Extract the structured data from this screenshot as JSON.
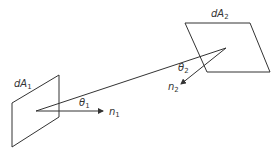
{
  "diagram": {
    "type": "radiation view factor between two differential areas",
    "colors": {
      "line": "#333333",
      "background": "#ffffff"
    },
    "surface1": {
      "label": "dA",
      "subscript": "1"
    },
    "surface2": {
      "label": "dA",
      "subscript": "2"
    },
    "normal1": {
      "label": "n",
      "subscript": "1"
    },
    "normal2": {
      "label": "n",
      "subscript": "2"
    },
    "angle1": {
      "label": "θ",
      "subscript": "1"
    },
    "angle2": {
      "label": "θ",
      "subscript": "2"
    }
  }
}
